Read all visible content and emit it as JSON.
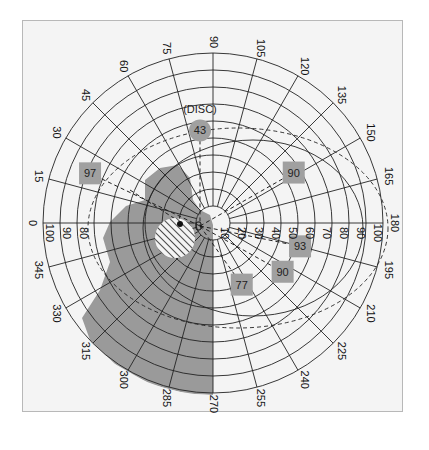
{
  "chart_data": {
    "type": "polar",
    "title": "",
    "center_px": [
      213,
      223
    ],
    "ring_step_px": 17,
    "radial_ticks": [
      10,
      20,
      30,
      40,
      50,
      60,
      70,
      80,
      90,
      100
    ],
    "radial_tick_labels_left": [
      80,
      90,
      100
    ],
    "angle_ticks": [
      0,
      15,
      30,
      45,
      60,
      75,
      90,
      105,
      120,
      135,
      150,
      165,
      180,
      195,
      210,
      225,
      240,
      255,
      270,
      285,
      300,
      315,
      330,
      345
    ],
    "grid": true,
    "disc": {
      "label": "(DISC)",
      "value": 43,
      "angle": 82,
      "radius": 55
    },
    "points": [
      {
        "value": 97,
        "angle": 22,
        "radius": 78
      },
      {
        "value": 90,
        "angle": 148,
        "radius": 56
      },
      {
        "value": 93,
        "angle": 195,
        "radius": 53
      },
      {
        "value": 90,
        "angle": 215,
        "radius": 50
      },
      {
        "value": 77,
        "angle": 245,
        "radius": 40
      }
    ],
    "shaded_region": "scotoma covering left-lower field (approx. angles 270-345 and central-left area)",
    "hatched_region": {
      "angle": 10,
      "radius": 20,
      "size": 14
    }
  },
  "colors": {
    "background": "#f4f4f4",
    "grid": "#222222",
    "shade": "#9a9a9a",
    "marker": "#a0a0a0",
    "frame": "#b8b8b8"
  }
}
